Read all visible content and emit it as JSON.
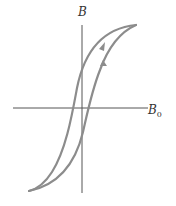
{
  "diagram": {
    "axes": {
      "y_label": "B",
      "x_label_main": "B",
      "x_label_sub": "0"
    },
    "colors": {
      "axis": "#555555",
      "curve": "#8c8c8c",
      "background": "#ffffff"
    },
    "curves": [
      {
        "name": "descending-branch",
        "direction": "down",
        "arrow": true
      },
      {
        "name": "ascending-branch",
        "direction": "up",
        "arrow": true
      }
    ]
  }
}
